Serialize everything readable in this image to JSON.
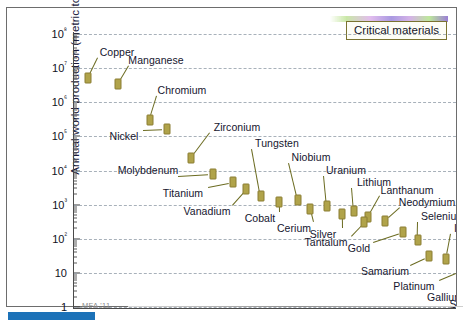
{
  "figure": {
    "credit": "MFA '11",
    "legend_label": "Critical materials",
    "accent_color": "#b0a34a",
    "bar_color": "#1c72b8"
  },
  "chart_data": {
    "type": "scatter",
    "title": "",
    "xlabel": "",
    "ylabel": "Annual world production (metric ton/yr)",
    "yscale": "log",
    "ylim": [
      1,
      100000000
    ],
    "grid": true,
    "legend_position": "top-right",
    "legend_entries": [
      "Critical materials"
    ],
    "ytick_labels": [
      "10⁸",
      "10⁷",
      "10⁶",
      "10⁵",
      "10⁴",
      "10³",
      "10²",
      "10",
      "1"
    ],
    "ytick_values": [
      100000000,
      10000000,
      1000000,
      100000,
      10000,
      1000,
      100,
      10,
      1
    ],
    "annotation": "MFA '11",
    "points": [
      {
        "label": "Copper",
        "rank": 1,
        "value": 16000000
      },
      {
        "label": "Manganese",
        "rank": 2,
        "value": 11000000
      },
      {
        "label": "Chromium",
        "rank": 3,
        "value": 2200000
      },
      {
        "label": "Nickel",
        "rank": 4,
        "value": 1600000
      },
      {
        "label": "Zirconium",
        "rank": 5,
        "value": 400000
      },
      {
        "label": "Molybdenum",
        "rank": 6,
        "value": 200000
      },
      {
        "label": "Titanium",
        "rank": 7,
        "value": 130000
      },
      {
        "label": "Tungsten",
        "rank": 8,
        "value": 72000
      },
      {
        "label": "Vanadium",
        "rank": 9,
        "value": 60000
      },
      {
        "label": "Niobium",
        "rank": 10,
        "value": 55000
      },
      {
        "label": "Cobalt",
        "rank": 11,
        "value": 42000
      },
      {
        "label": "Uranium",
        "rank": 12,
        "value": 35000
      },
      {
        "label": "Cerium",
        "rank": 13,
        "value": 26000
      },
      {
        "label": "Lithium",
        "rank": 14,
        "value": 21000
      },
      {
        "label": "Lanthanum",
        "rank": 15,
        "value": 16000
      },
      {
        "label": "Silver",
        "rank": 16,
        "value": 12000
      },
      {
        "label": "Neodymium",
        "rank": 17,
        "value": 9000
      },
      {
        "label": "Tantalum",
        "rank": 18,
        "value": 5000
      },
      {
        "label": "Gold",
        "rank": 19,
        "value": 2600
      },
      {
        "label": "Selenium",
        "rank": 20,
        "value": 1900
      },
      {
        "label": "Samarium",
        "rank": 21,
        "value": 900
      },
      {
        "label": "Indium",
        "rank": 22,
        "value": 600
      },
      {
        "label": "Platinum",
        "rank": 23,
        "value": 230
      },
      {
        "label": "Palladium",
        "rank": 24,
        "value": 200
      },
      {
        "label": "Gallium",
        "rank": 25,
        "value": 130
      },
      {
        "label": "Yttrium",
        "rank": 26,
        "value": 110
      },
      {
        "label": "Scandium",
        "rank": 27,
        "value": 90
      },
      {
        "label": "Rhodium",
        "rank": 28,
        "value": 30
      },
      {
        "label": "Iridium",
        "rank": 29,
        "value": 3
      }
    ],
    "point_layout": [
      {
        "label": "Copper",
        "px": 14,
        "py": 46,
        "lx": 43,
        "ly": 20,
        "ldx": 1,
        "ldy": -1
      },
      {
        "label": "Manganese",
        "px": 44,
        "py": 52,
        "lx": 82,
        "ly": 28,
        "ldx": 1,
        "ldy": -1
      },
      {
        "label": "Chromium",
        "px": 76,
        "py": 88,
        "lx": 108,
        "ly": 58,
        "ldx": 1,
        "ldy": -1
      },
      {
        "label": "Nickel",
        "px": 93,
        "py": 97,
        "lx": 50,
        "ly": 104,
        "ldx": -1,
        "ldy": 1
      },
      {
        "label": "Zirconium",
        "px": 117,
        "py": 126,
        "lx": 163,
        "ly": 95,
        "ldx": 1,
        "ldy": -1
      },
      {
        "label": "Molybdenum",
        "px": 139,
        "py": 142,
        "lx": 74,
        "ly": 138,
        "ldx": -1,
        "ldy": 0
      },
      {
        "label": "Titanium",
        "px": 159,
        "py": 150,
        "lx": 109,
        "ly": 161,
        "ldx": -1,
        "ldy": 1
      },
      {
        "label": "Tungsten",
        "px": 187,
        "py": 164,
        "lx": 203,
        "ly": 111,
        "ldx": 1,
        "ldy": -1
      },
      {
        "label": "Vanadium",
        "px": 172,
        "py": 157,
        "lx": 133,
        "ly": 179,
        "ldx": -1,
        "ldy": 1
      },
      {
        "label": "Niobium",
        "px": 224,
        "py": 168,
        "lx": 237,
        "ly": 125,
        "ldx": 1,
        "ldy": -1
      },
      {
        "label": "Cobalt",
        "px": 205,
        "py": 170,
        "lx": 186,
        "ly": 186,
        "ldx": -1,
        "ldy": 1
      },
      {
        "label": "Uranium",
        "px": 253,
        "py": 174,
        "lx": 272,
        "ly": 138,
        "ldx": 1,
        "ldy": -1
      },
      {
        "label": "Cerium",
        "px": 236,
        "py": 177,
        "lx": 220,
        "ly": 196,
        "ldx": -1,
        "ldy": 1
      },
      {
        "label": "Lithium",
        "px": 280,
        "py": 179,
        "lx": 300,
        "ly": 150,
        "ldx": 1,
        "ldy": -1
      },
      {
        "label": "Lanthanum",
        "px": 294,
        "py": 185,
        "lx": 333,
        "ly": 158,
        "ldx": 1,
        "ldy": -1
      },
      {
        "label": "Silver",
        "px": 268,
        "py": 182,
        "lx": 249,
        "ly": 202,
        "ldx": -1,
        "ldy": 1
      },
      {
        "label": "Neodymium",
        "px": 311,
        "py": 189,
        "lx": 353,
        "ly": 170,
        "ldx": 1,
        "ldy": -1
      },
      {
        "label": "Tantalum",
        "px": 290,
        "py": 190,
        "lx": 252,
        "ly": 210,
        "ldx": -1,
        "ldy": 1
      },
      {
        "label": "Gold",
        "px": 329,
        "py": 200,
        "lx": 285,
        "ly": 216,
        "ldx": -1,
        "ldy": 1
      },
      {
        "label": "Selenium",
        "px": 344,
        "py": 208,
        "lx": 369,
        "ly": 184,
        "ldx": 1,
        "ldy": -1
      },
      {
        "label": "Samarium",
        "px": 355,
        "py": 224,
        "lx": 311,
        "ly": 239,
        "ldx": -1,
        "ldy": 1
      },
      {
        "label": "Indium",
        "px": 372,
        "py": 227,
        "lx": 396,
        "ly": 196,
        "ldx": 1,
        "ldy": -1
      },
      {
        "label": "Platinum",
        "px": 386,
        "py": 239,
        "lx": 340,
        "ly": 254,
        "ldx": -1,
        "ldy": 1
      },
      {
        "label": "Palladium",
        "px": 400,
        "py": 236,
        "lx": 422,
        "ly": 212,
        "ldx": 1,
        "ldy": -1
      },
      {
        "label": "Gallium",
        "px": 409,
        "py": 247,
        "lx": 371,
        "ly": 265,
        "ldx": -1,
        "ldy": 1
      },
      {
        "label": "Yttrium",
        "px": 427,
        "py": 244,
        "lx": 437,
        "ly": 225,
        "ldx": 1,
        "ldy": -1
      },
      {
        "label": "Scandium",
        "px": 418,
        "py": 252,
        "lx": 399,
        "ly": 272,
        "ldx": -1,
        "ldy": 1
      },
      {
        "label": "Rhodium",
        "px": 442,
        "py": 262,
        "lx": 418,
        "ly": 283,
        "ldx": -1,
        "ldy": 1
      },
      {
        "label": "Iridium",
        "px": 437,
        "py": 298,
        "lx": 405,
        "ly": 306,
        "ldx": -1,
        "ldy": 1
      }
    ]
  }
}
